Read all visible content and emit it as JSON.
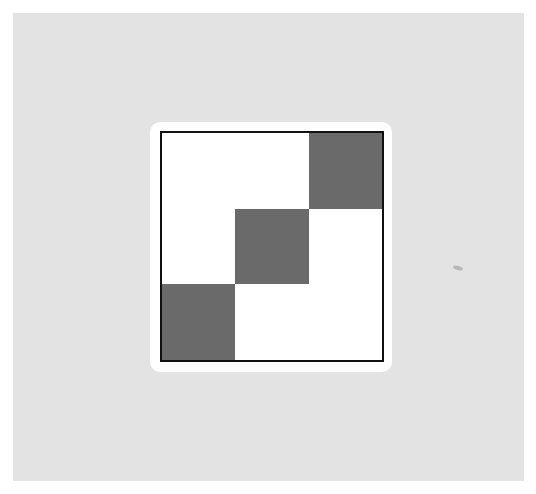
{
  "figure": {
    "background_color": "#e3e3e3",
    "card_color": "#ffffff",
    "border_color": "#111111",
    "filled_color": "#6a6a6a",
    "grid": {
      "rows": 3,
      "cols": 3,
      "cells": [
        [
          0,
          0,
          1
        ],
        [
          0,
          1,
          0
        ],
        [
          1,
          0,
          0
        ]
      ]
    }
  }
}
